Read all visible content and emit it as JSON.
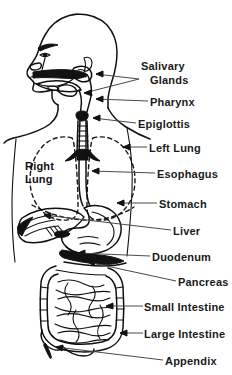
{
  "figure": {
    "background_color": "#ffffff",
    "line_color": "#101010",
    "leader_color": "#4a4a4a",
    "text_color": "#1a1a1a"
  },
  "inner_labels": [
    {
      "name": "right-lung",
      "line1": "Right",
      "line2": "Lung"
    }
  ],
  "callout_labels": [
    {
      "name": "salivary-glands",
      "line1": "Salivary",
      "line2": "Glands"
    },
    {
      "name": "pharynx",
      "text": "Pharynx"
    },
    {
      "name": "epiglottis",
      "text": "Epiglottis"
    },
    {
      "name": "left-lung",
      "text": "Left  Lung"
    },
    {
      "name": "esophagus",
      "text": "Esophagus"
    },
    {
      "name": "stomach",
      "text": "Stomach"
    },
    {
      "name": "liver",
      "text": "Liver"
    },
    {
      "name": "duodenum",
      "text": "Duodenum"
    },
    {
      "name": "pancreas",
      "text": "Pancreas"
    },
    {
      "name": "small-intestine",
      "text": "Small  Intestine"
    },
    {
      "name": "large-intestine",
      "text": "Large  Intestine"
    },
    {
      "name": "appendix",
      "text": "Appendix"
    }
  ]
}
